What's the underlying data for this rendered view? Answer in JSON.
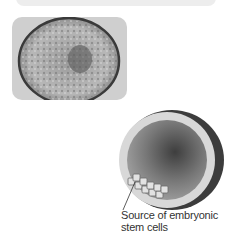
{
  "figure": {
    "photo": {
      "description": "Micrograph of a human blastocyst",
      "background": "#cfcfcf"
    },
    "diagram": {
      "description": "Cross-section illustration of blastocyst",
      "outer_color": "#4a4a4a",
      "cavity_color": "#8a8a8a",
      "cell_color": "#d6d6d6"
    },
    "caption": {
      "line1": "Source of embryonic",
      "line2": "stem cells"
    }
  }
}
